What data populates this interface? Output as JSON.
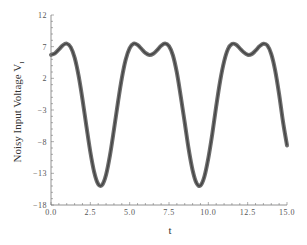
{
  "chart_data": {
    "type": "line",
    "title": "",
    "xlabel": "t",
    "ylabel": "Noisy Input Voltage V",
    "ylabel_subscript": "I",
    "xlim": [
      0,
      15
    ],
    "ylim": [
      -18,
      12
    ],
    "grid": false,
    "legend": null,
    "x_ticks": [
      "0.0",
      "2.5",
      "5.0",
      "7.5",
      "10.0",
      "12.5",
      "15.0"
    ],
    "x_tick_values": [
      0,
      2.5,
      5,
      7.5,
      10,
      12.5,
      15
    ],
    "y_ticks": [
      "12",
      "7",
      "2",
      "−3",
      "−8",
      "−13",
      "−18"
    ],
    "y_tick_values": [
      12,
      7,
      2,
      -3,
      -8,
      -13,
      -18
    ],
    "series": [
      {
        "name": "Noisy Input Voltage",
        "color": "#555555",
        "band_width": 0.5,
        "x": [
          0,
          0.25,
          0.5,
          0.75,
          1,
          1.25,
          1.5,
          1.75,
          2,
          2.25,
          2.5,
          2.75,
          3,
          3.25,
          3.5,
          3.75,
          4,
          4.25,
          4.5,
          4.75,
          5,
          5.25,
          5.5,
          5.75,
          6,
          6.25,
          6.5,
          6.75,
          7,
          7.25,
          7.5,
          7.75,
          8,
          8.25,
          8.5,
          8.75,
          9,
          9.25,
          9.5,
          9.75,
          10,
          10.25,
          10.5,
          10.75,
          11,
          11.25,
          11.5,
          11.75,
          12,
          12.25,
          12.5,
          12.75,
          13,
          13.25,
          13.5,
          13.75,
          14,
          14.25,
          14.5,
          14.75,
          15
        ],
        "values": [
          5.7,
          5.94,
          6.56,
          7.22,
          7.48,
          6.93,
          5.28,
          2.45,
          -1.32,
          -5.56,
          -9.63,
          -12.87,
          -14.71,
          -14.83,
          -13.21,
          -10.12,
          -6.12,
          -1.87,
          2.0,
          4.97,
          6.78,
          7.47,
          7.28,
          6.65,
          6.01,
          5.7,
          5.89,
          6.46,
          7.14,
          7.49,
          7.07,
          5.63,
          2.89,
          -0.91,
          -4.99,
          -9.19,
          -12.51,
          -14.55,
          -14.92,
          -13.5,
          -10.6,
          -6.79,
          -2.42,
          1.57,
          4.64,
          6.63,
          7.43,
          7.34,
          6.74,
          6.11,
          5.72,
          5.82,
          6.37,
          7.05,
          7.47,
          7.2,
          5.83,
          3.23,
          -0.53,
          -4.92,
          -8.6
        ]
      }
    ]
  }
}
